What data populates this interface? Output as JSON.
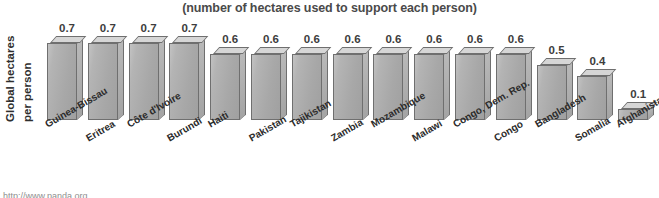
{
  "chart_data": {
    "type": "bar",
    "title": "(number of hectares used to support each person)",
    "xlabel": "",
    "ylabel_line1": "Global hectares",
    "ylabel_line2": "per person",
    "ylim": [
      0,
      0.75
    ],
    "grid": false,
    "legend": "none",
    "categories": [
      "Guinea-Bissau",
      "Eritrea",
      "Côte d'Ivoire",
      "Burundi",
      "Haiti",
      "Pakistan",
      "Tajikistan",
      "Zambia",
      "Mozambique",
      "Malawi",
      "Congo, Dem. Rep.",
      "Congo",
      "Bangladesh",
      "Somalia",
      "Afghanistan"
    ],
    "values": [
      0.7,
      0.7,
      0.7,
      0.7,
      0.6,
      0.6,
      0.6,
      0.6,
      0.6,
      0.6,
      0.6,
      0.6,
      0.5,
      0.4,
      0.1
    ],
    "value_labels": [
      "0.7",
      "0.7",
      "0.7",
      "0.7",
      "0.6",
      "0.6",
      "0.6",
      "0.6",
      "0.6",
      "0.6",
      "0.6",
      "0.6",
      "0.5",
      "0.4",
      "0.1"
    ]
  },
  "footer": {
    "url": "http://www.panda.org"
  },
  "colors": {
    "bar_front": "#a8a8a8",
    "bar_top": "#d6d6d6",
    "bar_side": "#b0b0b0",
    "bar_outline": "#6f6f6f",
    "text": "#2e2e2e",
    "title_text": "#4a4a4a",
    "background": "#ffffff"
  }
}
